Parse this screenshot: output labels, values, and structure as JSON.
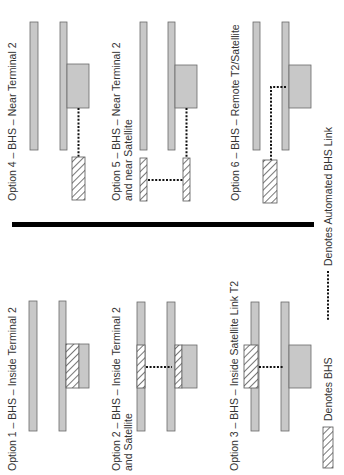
{
  "colors": {
    "bar_fill": "#c8c8c8",
    "bar_stroke": "#6a6a6a",
    "hatch_stroke": "#555555",
    "link_dots": "#111111",
    "separator": "#000000",
    "text": "#333333"
  },
  "options": [
    {
      "id": 1,
      "line1": "Option 1 – BHS – Inside Terminal 2",
      "line2": ""
    },
    {
      "id": 2,
      "line1": "Option 2 – BHS – Inside Terminal 2",
      "line2": "and Satellite"
    },
    {
      "id": 3,
      "line1": "Option 3 – BHS – Inside Satellite Link T2",
      "line2": ""
    },
    {
      "id": 4,
      "line1": "Option 4 – BHS – Near Terminal 2",
      "line2": ""
    },
    {
      "id": 5,
      "line1": "Option 5 – BHS – Near Terminal 2",
      "line2": "and near Satellite"
    },
    {
      "id": 6,
      "line1": "Option 6 – BHS – Remote T2/Satellite",
      "line2": ""
    }
  ],
  "legend": {
    "bhs": "Denotes BHS",
    "link": "Denotes Automated BHS Link"
  }
}
